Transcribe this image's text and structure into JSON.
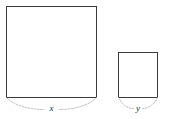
{
  "figure": {
    "background_color": "#ffffff",
    "stroke_color": "#3a3a3a",
    "brace_color": "#b6b6b6",
    "label_color": "#2b2b2b"
  },
  "shapes": [
    {
      "name": "large-square",
      "label": "x",
      "x": 6,
      "y": 6,
      "width": 91,
      "height": 92
    },
    {
      "name": "small-square",
      "label": "y",
      "x": 118,
      "y": 52,
      "width": 40,
      "height": 46
    }
  ],
  "labels": {
    "large_side": "x",
    "small_side": "y"
  }
}
